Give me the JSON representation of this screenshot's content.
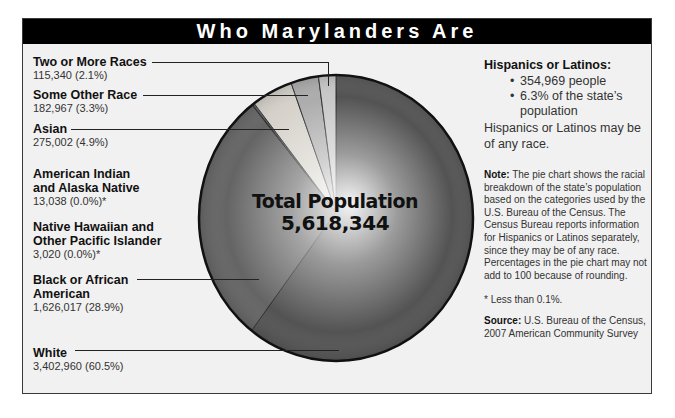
{
  "title": "Who Marylanders Are",
  "center_label": {
    "line1": "Total Population",
    "line2": "5,618,344"
  },
  "labels": [
    {
      "name": "Two or More Races",
      "value": "115,340 (2.1%)"
    },
    {
      "name": "Some Other Race",
      "value": "182,967 (3.3%)"
    },
    {
      "name": "Asian",
      "value": "275,002 (4.9%)"
    },
    {
      "name_line1": "American Indian",
      "name_line2": "and Alaska Native",
      "value": "13,038 (0.0%)*"
    },
    {
      "name_line1": "Native Hawaiian and",
      "name_line2": "Other Pacific Islander",
      "value": "3,020 (0.0%)*"
    },
    {
      "name_line1": "Black or African",
      "name_line2": "American",
      "value": "1,626,017 (28.9%)"
    },
    {
      "name": "White",
      "value": "3,402,960 (60.5%)"
    }
  ],
  "hispanic": {
    "title": "Hispanics or Latinos:",
    "bullets": [
      "354,969 people",
      "6.3% of the state’s",
      "population"
    ],
    "note": "Hispanics or Latinos may be of any race."
  },
  "note": {
    "label": "Note:",
    "text": " The pie chart shows the racial breakdown of the state’s population based on the categories used by the U.S. Bureau of the Census. The Census Bureau reports information for Hispanics or Latinos separately, since they may be of any race. Percentages in the pie chart may not add to 100 because of rounding."
  },
  "footnote": "* Less than 0.1%.",
  "source": {
    "label": "Source:",
    "text": " U.S. Bureau of the Census, 2007 American Community Survey"
  },
  "colors": {
    "header_bg": "#000000",
    "panel_bg": "#f1f1f1",
    "white_slice": "#4a4a4a",
    "black_slice": "#5c5c5c",
    "asian_slice": "#d4d0c8",
    "other_slice": "#a8a8a8",
    "two_more_slice": "#c4c4c4"
  },
  "chart_data": {
    "type": "pie",
    "title": "Who Marylanders Are",
    "total": 5618344,
    "center_label": "Total Population 5,618,344",
    "categories": [
      "White",
      "Black or African American",
      "Native Hawaiian and Other Pacific Islander",
      "American Indian and Alaska Native",
      "Asian",
      "Some Other Race",
      "Two or More Races"
    ],
    "values": [
      3402960,
      1626017,
      3020,
      13038,
      275002,
      182967,
      115340
    ],
    "percentages": [
      60.5,
      28.9,
      0.0,
      0.0,
      4.9,
      3.3,
      2.1
    ],
    "annotations": [
      "* Less than 0.1%."
    ],
    "legend_position": "left labels with leader lines"
  }
}
